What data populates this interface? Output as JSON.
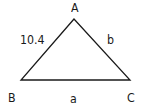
{
  "diagram": {
    "type": "triangle",
    "stroke_color": "#1a1a1a",
    "background": "#ffffff",
    "vertices": [
      {
        "name": "A",
        "x": 74,
        "y": 19
      },
      {
        "name": "B",
        "x": 21,
        "y": 80
      },
      {
        "name": "C",
        "x": 130,
        "y": 80
      }
    ],
    "labels": {
      "vertex_a": "A",
      "vertex_b": "B",
      "vertex_c": "C",
      "side_ab": "10.4",
      "side_ac": "b",
      "side_bc": "a"
    }
  }
}
